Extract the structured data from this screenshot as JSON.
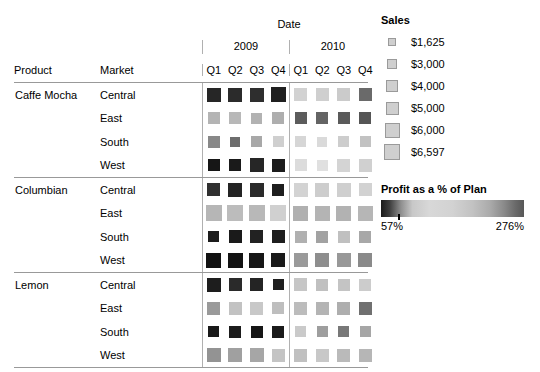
{
  "header": {
    "date_label": "Date",
    "product_label": "Product",
    "market_label": "Market",
    "years": [
      "2009",
      "2010"
    ],
    "quarters": [
      "Q1",
      "Q2",
      "Q3",
      "Q4"
    ]
  },
  "sales_legend": {
    "title": "Sales",
    "items": [
      {
        "label": "$1,625",
        "value": 1625,
        "size": 8
      },
      {
        "label": "$3,000",
        "value": 3000,
        "size": 10
      },
      {
        "label": "$4,000",
        "value": 4000,
        "size": 12
      },
      {
        "label": "$5,000",
        "value": 5000,
        "size": 13
      },
      {
        "label": "$6,000",
        "value": 6000,
        "size": 15
      },
      {
        "label": "$6,597",
        "value": 6597,
        "size": 16
      }
    ]
  },
  "profit_legend": {
    "title": "Profit as a % of Plan",
    "min_label": "57%",
    "max_label": "276%"
  },
  "chart_data": {
    "type": "heatmap",
    "title": "",
    "xlabel": "Date",
    "ylabel": "Product / Market",
    "size_encoding": "Sales",
    "color_encoding": "Profit as a % of Plan",
    "color_range": [
      57,
      276
    ],
    "size_range": [
      1625,
      6597
    ],
    "columns": [
      "2009 Q1",
      "2009 Q2",
      "2009 Q3",
      "2009 Q4",
      "2010 Q1",
      "2010 Q2",
      "2010 Q3",
      "2010 Q4"
    ],
    "rows": [
      {
        "product": "Caffe Mocha",
        "markets": [
          {
            "market": "Central",
            "size": [
              14,
              14,
              14,
              15,
              13,
              13,
              13,
              13
            ],
            "color": [
              "#262626",
              "#2b2b2b",
              "#2e2e2e",
              "#1f1f1f",
              "#d2d2d2",
              "#cfcfcf",
              "#cbcbcb",
              "#6a6a6a"
            ]
          },
          {
            "market": "East",
            "size": [
              12,
              12,
              11,
              12,
              12,
              12,
              12,
              12
            ],
            "color": [
              "#b4b4b4",
              "#b8b8b8",
              "#b2b2b2",
              "#aeaeae",
              "#5c5c5c",
              "#646464",
              "#5a5a5a",
              "#555555"
            ]
          },
          {
            "market": "South",
            "size": [
              12,
              10,
              11,
              11,
              11,
              10,
              11,
              11
            ],
            "color": [
              "#888888",
              "#6d6d6d",
              "#a8a8a8",
              "#cfcfcf",
              "#d6d6d6",
              "#dadada",
              "#cdcdcd",
              "#c2c2c2"
            ]
          },
          {
            "market": "West",
            "size": [
              12,
              12,
              14,
              13,
              12,
              11,
              13,
              13
            ],
            "color": [
              "#161616",
              "#1a1a1a",
              "#262626",
              "#1c1c1c",
              "#dcdcdc",
              "#e0e0e0",
              "#d4d4d4",
              "#d0d0d0"
            ]
          }
        ]
      },
      {
        "product": "Columbian",
        "markets": [
          {
            "market": "Central",
            "size": [
              13,
              14,
              14,
              12,
              14,
              14,
              14,
              13
            ],
            "color": [
              "#303030",
              "#242424",
              "#2a2a2a",
              "#1e1e1e",
              "#d3d3d3",
              "#cdcdcd",
              "#cfcfcf",
              "#d2d2d2"
            ]
          },
          {
            "market": "East",
            "size": [
              16,
              16,
              16,
              16,
              15,
              15,
              15,
              15
            ],
            "color": [
              "#b6b6b6",
              "#bcbcbc",
              "#b8b8b8",
              "#d0d0d0",
              "#b0b0b0",
              "#b4b4b4",
              "#b2b2b2",
              "#b6b6b6"
            ]
          },
          {
            "market": "South",
            "size": [
              11,
              13,
              13,
              13,
              12,
              12,
              12,
              12
            ],
            "color": [
              "#1c1c1c",
              "#1a1a1a",
              "#222222",
              "#1e1e1e",
              "#b0b0b0",
              "#a2a2a2",
              "#c0c0c0",
              "#a8a8a8"
            ]
          },
          {
            "market": "West",
            "size": [
              15,
              15,
              15,
              14,
              14,
              14,
              14,
              14
            ],
            "color": [
              "#111111",
              "#131313",
              "#161616",
              "#1a1a1a",
              "#9a9a9a",
              "#8e8e8e",
              "#989898",
              "#8a8a8a"
            ]
          }
        ]
      },
      {
        "product": "Lemon",
        "markets": [
          {
            "market": "Central",
            "size": [
              14,
              13,
              13,
              11,
              13,
              12,
              12,
              12
            ],
            "color": [
              "#1d1d1d",
              "#2a2a2a",
              "#242424",
              "#1f1f1f",
              "#c6c6c6",
              "#c0c0c0",
              "#c4c4c4",
              "#cccccc"
            ]
          },
          {
            "market": "East",
            "size": [
              13,
              13,
              13,
              12,
              13,
              13,
              13,
              13
            ],
            "color": [
              "#9a9a9a",
              "#c2c2c2",
              "#c8c8c8",
              "#bebebe",
              "#bcbcbc",
              "#b4b4b4",
              "#aeaeae",
              "#707070"
            ]
          },
          {
            "market": "South",
            "size": [
              11,
              12,
              12,
              12,
              11,
              11,
              11,
              11
            ],
            "color": [
              "#191919",
              "#1c1c1c",
              "#161616",
              "#1a1a1a",
              "#cacaca",
              "#9e9e9e",
              "#787878",
              "#a6a6a6"
            ]
          },
          {
            "market": "West",
            "size": [
              14,
              14,
              14,
              13,
              13,
              13,
              13,
              13
            ],
            "color": [
              "#939393",
              "#a0a0a0",
              "#a6a6a6",
              "#c4c4c4",
              "#c0c0c0",
              "#c8c8c8",
              "#bababa",
              "#b6b6b6"
            ]
          }
        ]
      }
    ]
  }
}
